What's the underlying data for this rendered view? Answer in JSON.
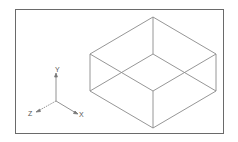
{
  "diagram": {
    "type": "isometric-wireframe",
    "object": "rectangular box",
    "axes": {
      "x_label": "X",
      "y_label": "Y",
      "z_label": "Z"
    },
    "colors": {
      "line": "#8a8a8a",
      "frame": "#6a6a6a",
      "background": "#ffffff"
    }
  }
}
